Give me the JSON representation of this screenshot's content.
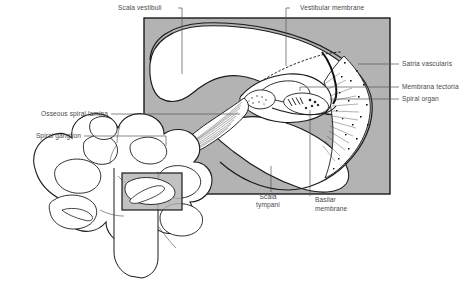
{
  "figure": {
    "colors": {
      "panel_fill": "#b3b3b3",
      "panel_border": "#1a1a1a",
      "lumen_fill": "#ffffff",
      "outline": "#1a1a1a",
      "label_text": "#4a4a4a",
      "leader_line": "#555555",
      "inset_fill": "#b3b3b3"
    }
  },
  "labels": [
    {
      "id": "scala-vestibuli",
      "text": "Scala vestibuli",
      "side": "top-left"
    },
    {
      "id": "vestibular-membrane",
      "text": "Vestibular membrane",
      "side": "top-right"
    },
    {
      "id": "stria-vascularis",
      "text": "Satria vascularis",
      "side": "right"
    },
    {
      "id": "membrana-tectoria",
      "text": "Membrana tectoria",
      "side": "right"
    },
    {
      "id": "spiral-organ",
      "text": "Spiral organ",
      "side": "right"
    },
    {
      "id": "osseous-spiral-lamina",
      "text": "Osseous spiral lamina",
      "side": "left"
    },
    {
      "id": "spiral-ganglion",
      "text": "Spiral ganglion",
      "side": "left"
    },
    {
      "id": "scala-tympani-1",
      "text": "Scala",
      "side": "bottom"
    },
    {
      "id": "scala-tympani-2",
      "text": "tympani",
      "side": "bottom"
    },
    {
      "id": "basilar-membrane-1",
      "text": "Basilar",
      "side": "bottom"
    },
    {
      "id": "basilar-membrane-2",
      "text": "membrane",
      "side": "bottom"
    }
  ]
}
